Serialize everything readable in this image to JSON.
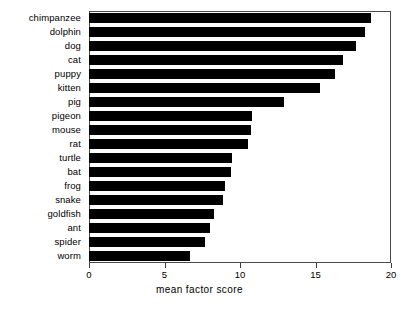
{
  "chart_data": {
    "type": "bar",
    "orientation": "horizontal",
    "title": "",
    "xlabel": "mean factor score",
    "ylabel": "",
    "xlim": [
      0,
      20
    ],
    "ylim": null,
    "xticks": [
      0,
      5,
      10,
      15,
      20
    ],
    "xticklabels": [
      "0",
      "5",
      "10",
      "15",
      "20"
    ],
    "grid": false,
    "legend": false,
    "bar_color": "#000000",
    "frame_color": "#4a4a4a",
    "background": "#ffffff",
    "categories": [
      "chimpanzee",
      "dolphin",
      "dog",
      "cat",
      "puppy",
      "kitten",
      "pig",
      "pigeon",
      "mouse",
      "rat",
      "turtle",
      "bat",
      "frog",
      "snake",
      "goldfish",
      "ant",
      "spider",
      "worm"
    ],
    "values": [
      18.7,
      18.3,
      17.7,
      16.8,
      16.3,
      15.3,
      12.9,
      10.8,
      10.7,
      10.5,
      9.5,
      9.4,
      9.0,
      8.9,
      8.3,
      8.0,
      7.7,
      6.7
    ]
  }
}
